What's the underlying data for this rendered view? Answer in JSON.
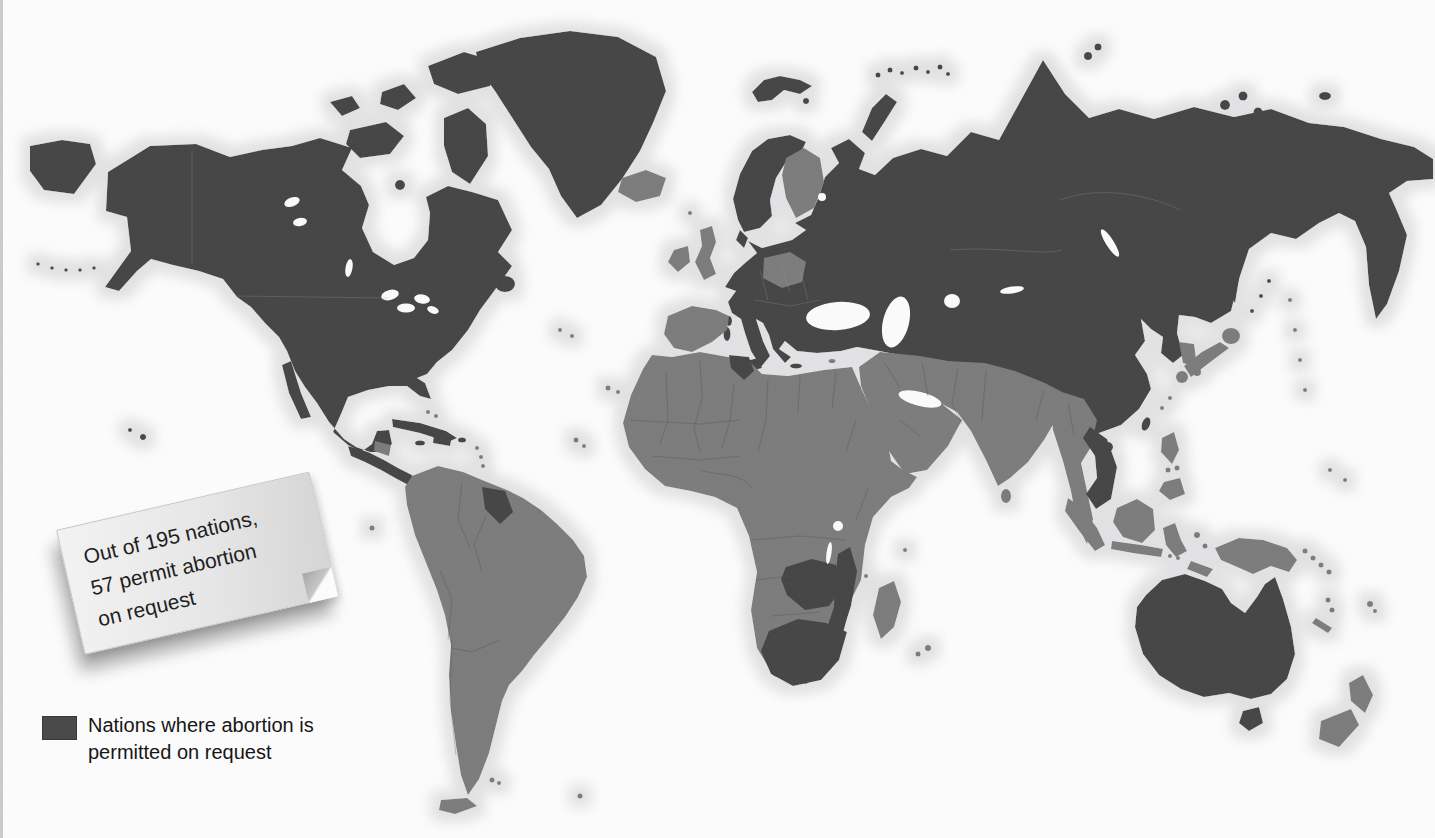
{
  "figure": {
    "type": "choropleth-world-map",
    "subject": "Nations where abortion is permitted on request",
    "style": "grayscale scanned book figure"
  },
  "note": {
    "line1": "Out of 195 nations,",
    "line2": "57 permit abortion",
    "line3": "on request"
  },
  "legend": {
    "line1": "Nations where abortion is",
    "line2": "permitted on request",
    "swatch_color": "#4a4a4a"
  },
  "stats": {
    "total_nations": 195,
    "nations_permitting_on_request": 57
  },
  "map": {
    "colors": {
      "permitted_dark": "#454545",
      "other_nations_gray": "#7b7b7b",
      "coastal_halo": "#e3e3e5",
      "ocean": "#fcfcfc"
    },
    "regions_shaded_dark": [
      "United States",
      "Canada",
      "Alaska",
      "Greenland",
      "Mexico",
      "Cuba",
      "Central America",
      "Guyana",
      "most of Europe",
      "Scandinavia",
      "Turkey",
      "Russia",
      "Central Asia",
      "China",
      "Mongolia",
      "Vietnam",
      "Cambodia",
      "Tunisia",
      "Zambia",
      "Mozambique",
      "South Africa",
      "Australia",
      "Tasmania"
    ],
    "regions_shaded_gray": [
      "most of South America",
      "most of Africa",
      "Middle East",
      "Iran",
      "Pakistan",
      "India",
      "Myanmar",
      "Thailand",
      "Indonesia",
      "Philippines",
      "Japan",
      "New Guinea",
      "New Zealand",
      "United Kingdom",
      "Ireland",
      "Iceland",
      "Finland",
      "Poland",
      "Spain and Portugal",
      "Madagascar"
    ]
  }
}
